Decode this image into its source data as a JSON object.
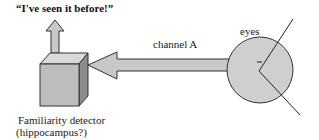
{
  "title": "“I've seen it before!”",
  "labels": {
    "channel": "channel A",
    "eyes": "eyes",
    "detector_line1": "Familiarity detector",
    "detector_line2": "(hippocampus?)"
  },
  "colors": {
    "fill_light": "#d3d3d3",
    "fill_mid": "#bdbdbd",
    "fill_dark": "#8f8f8f",
    "stroke": "#333333"
  }
}
